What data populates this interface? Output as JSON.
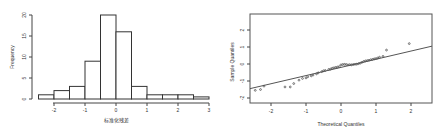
{
  "chart_data": [
    {
      "type": "bar",
      "subtype": "histogram",
      "title": "",
      "xlabel": "标准化残差",
      "ylabel": "Frequency",
      "bin_edges": [
        -2.5,
        -2.0,
        -1.5,
        -1.0,
        -0.5,
        0.0,
        0.5,
        1.0,
        1.5,
        2.0,
        2.5,
        3.0
      ],
      "values": [
        1,
        2,
        3,
        9,
        20,
        16,
        3,
        1,
        1,
        1,
        0.5
      ],
      "xticks": [
        "-2",
        "-1",
        "0",
        "1",
        "2",
        "3"
      ],
      "xtick_values": [
        -2,
        -1,
        0,
        1,
        2,
        3
      ],
      "yticks": [
        "0",
        "5",
        "10",
        "15",
        "20"
      ],
      "ytick_values": [
        0,
        5,
        10,
        15,
        20
      ],
      "xlim": [
        -2.5,
        3.0
      ],
      "ylim": [
        0,
        20
      ],
      "grid": false
    },
    {
      "type": "scatter",
      "subtype": "qq-plot",
      "title": "",
      "xlabel": "Theoretical Quantiles",
      "ylabel": "Sample Quantiles",
      "xticks": [
        "-2",
        "-1",
        "0",
        "1",
        "2"
      ],
      "xtick_values": [
        -2,
        -1,
        0,
        1,
        2
      ],
      "yticks": [
        "-2",
        "-1",
        "0",
        "1",
        "2"
      ],
      "ytick_values": [
        -2,
        -1,
        0,
        1,
        2
      ],
      "xlim": [
        -2.6,
        2.6
      ],
      "ylim": [
        -2.3,
        2.9
      ],
      "grid": false,
      "reference_line": {
        "x": [
          -2.6,
          2.6
        ],
        "y": [
          -1.45,
          1.05
        ]
      },
      "points": {
        "x": [
          -2.45,
          -2.3,
          -2.2,
          -1.6,
          -1.45,
          -1.35,
          -1.2,
          -1.1,
          -1.0,
          -0.95,
          -0.85,
          -0.8,
          -0.7,
          -0.65,
          -0.55,
          -0.5,
          -0.45,
          -0.35,
          -0.3,
          -0.25,
          -0.2,
          -0.15,
          -0.1,
          -0.05,
          0.0,
          0.05,
          0.1,
          0.15,
          0.2,
          0.25,
          0.3,
          0.35,
          0.4,
          0.45,
          0.5,
          0.55,
          0.6,
          0.65,
          0.7,
          0.75,
          0.8,
          0.85,
          0.9,
          0.95,
          1.0,
          1.05,
          1.1,
          1.2,
          1.3,
          1.95
        ],
        "y": [
          -1.55,
          -1.5,
          -1.3,
          -1.35,
          -1.35,
          -1.15,
          -0.95,
          -0.85,
          -0.82,
          -0.75,
          -0.7,
          -0.65,
          -0.58,
          -0.52,
          -0.45,
          -0.4,
          -0.38,
          -0.32,
          -0.3,
          -0.25,
          -0.22,
          -0.2,
          -0.18,
          -0.15,
          -0.05,
          -0.03,
          -0.02,
          -0.03,
          -0.05,
          -0.04,
          -0.05,
          -0.03,
          -0.02,
          -0.01,
          0.02,
          0.05,
          0.1,
          0.15,
          0.18,
          0.2,
          0.22,
          0.25,
          0.27,
          0.3,
          0.32,
          0.35,
          0.4,
          0.45,
          0.82,
          1.2
        ]
      }
    }
  ],
  "histogram": {
    "xlabel": "标准化残差",
    "ylabel": "Frequency",
    "xticks": [
      "-2",
      "-1",
      "0",
      "1",
      "2",
      "3"
    ],
    "yticks": [
      "0",
      "5",
      "10",
      "15",
      "20"
    ]
  },
  "qqplot": {
    "xlabel": "Theoretical Quantiles",
    "ylabel": "Sample Quantiles",
    "xticks": [
      "-2",
      "-1",
      "0",
      "1",
      "2"
    ],
    "yticks": [
      "-2",
      "-1",
      "0",
      "1",
      "2"
    ]
  }
}
